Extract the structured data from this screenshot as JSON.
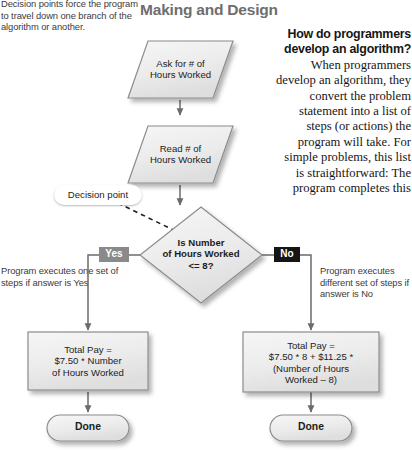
{
  "running_head": "Making and Design",
  "notes": {
    "top_left": "Decision points force the program to travel down one branch of the algorithm or another.",
    "yes_branch": "Program executes one set of steps if answer is Yes",
    "no_branch": "Program executes different set of steps if answer is No"
  },
  "callout": {
    "decision_point": "Decision point"
  },
  "qa": {
    "question": "How do programmers develop an algorithm?",
    "answer": "When programmers develop an algorithm, they convert the problem statement into a list of steps (or actions) the program will take. For simple problems, this list is straightforward: The program completes this"
  },
  "flowchart": {
    "type": "flowchart",
    "nodes": [
      {
        "id": "input-ask",
        "shape": "parallelogram",
        "label": "Ask for # of\nHours Worked"
      },
      {
        "id": "input-read",
        "shape": "parallelogram",
        "label": "Read # of\nHours Worked"
      },
      {
        "id": "decision",
        "shape": "diamond",
        "label": "Is Number\nof Hours Worked\n<= 8?"
      },
      {
        "id": "process-yes",
        "shape": "rectangle",
        "label": "Total Pay =\n$7.50 * Number\nof Hours Worked"
      },
      {
        "id": "process-no",
        "shape": "rectangle",
        "label": "Total Pay =\n$7.50 * 8 + $11.25 *\n(Number of Hours\nWorked – 8)"
      },
      {
        "id": "done-left",
        "shape": "terminator",
        "label": "Done"
      },
      {
        "id": "done-right",
        "shape": "terminator",
        "label": "Done"
      }
    ],
    "branch_labels": {
      "yes": "Yes",
      "no": "No"
    },
    "colors": {
      "shape_fill": "#ededed",
      "shape_stroke": "#8c8c8c",
      "connector": "#6b6b6b",
      "yes_badge": "#8a8a8a",
      "no_badge": "#151515",
      "heading": "#6e6e6e"
    }
  }
}
